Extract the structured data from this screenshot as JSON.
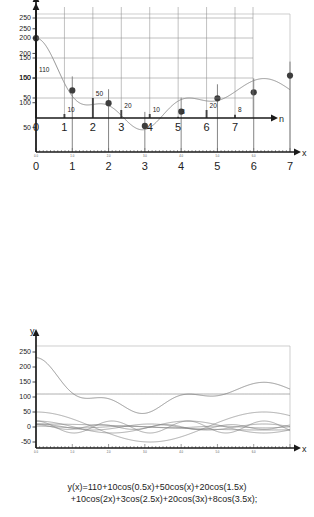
{
  "figure": {
    "caption_line1": "y(x)=110+10cos(0.5x)+50cos(x)+20cos(1.5x)",
    "caption_line2": "+10cos(2x)+3cos(2.5x)+20cos(3x)+8cos(3.5x);"
  },
  "chart_data": [
    {
      "type": "line",
      "id": "panel-top-samples",
      "title": "",
      "xlabel": "x",
      "ylabel": "",
      "xlim": [
        0,
        7
      ],
      "ylim": [
        0,
        280
      ],
      "yticks": [
        50,
        100,
        150,
        200,
        250
      ],
      "xticks_major": [
        "0",
        "1",
        "2",
        "3",
        "4",
        "5",
        "6",
        "7"
      ],
      "xticks_minor": [
        "0.0",
        "1.0",
        "2.0",
        "3.0",
        "4.0",
        "5.0",
        "6.0"
      ],
      "grid": false,
      "legend": "none",
      "x": [
        0,
        1,
        2,
        3,
        4,
        5,
        6,
        7
      ],
      "values": [
        231,
        125,
        99,
        53,
        82,
        109,
        121,
        155
      ],
      "markers": "filled-circle",
      "stems": true
    },
    {
      "type": "bar",
      "id": "panel-middle-spectrum",
      "title": "",
      "xlabel": "n",
      "ylabel": "",
      "xlim": [
        0,
        7
      ],
      "ylim": [
        0,
        280
      ],
      "yticks": [
        50,
        100,
        150,
        200,
        250
      ],
      "categories": [
        "0",
        "1",
        "2",
        "3",
        "4",
        "5",
        "6",
        "7"
      ],
      "values": [
        110,
        10,
        50,
        20,
        10,
        3,
        20,
        8
      ],
      "data_labels": [
        "110",
        "10",
        "50",
        "20",
        "10",
        "3",
        "20",
        "8"
      ],
      "grid": true,
      "legend": "none"
    },
    {
      "type": "line",
      "id": "panel-bottom-components",
      "title": "",
      "xlabel": "x",
      "ylabel": "y",
      "xlim": [
        0,
        7
      ],
      "ylim": [
        -70,
        270
      ],
      "yticks": [
        -50,
        0,
        50,
        100,
        150,
        200,
        250
      ],
      "xticks_minor": [
        "0.0",
        "1.0",
        "2.0",
        "3.0",
        "4.0",
        "5.0",
        "6.0"
      ],
      "grid": false,
      "legend": "none",
      "series": [
        {
          "name": "y(x) sum",
          "dc": 110,
          "terms": [
            [
              10,
              0.5
            ],
            [
              50,
              1
            ],
            [
              20,
              1.5
            ],
            [
              10,
              2
            ],
            [
              3,
              2.5
            ],
            [
              20,
              3
            ],
            [
              8,
              3.5
            ]
          ]
        },
        {
          "name": "110 (DC)",
          "amplitude": 110,
          "freq": 0
        },
        {
          "name": "10cos(0.5x)",
          "amplitude": 10,
          "freq": 0.5
        },
        {
          "name": "50cos(x)",
          "amplitude": 50,
          "freq": 1
        },
        {
          "name": "20cos(1.5x)",
          "amplitude": 20,
          "freq": 1.5
        },
        {
          "name": "10cos(2x)",
          "amplitude": 10,
          "freq": 2
        },
        {
          "name": "3cos(2.5x)",
          "amplitude": 3,
          "freq": 2.5
        },
        {
          "name": "20cos(3x)",
          "amplitude": 20,
          "freq": 3
        },
        {
          "name": "8cos(3.5x)",
          "amplitude": 8,
          "freq": 3.5
        }
      ]
    }
  ]
}
